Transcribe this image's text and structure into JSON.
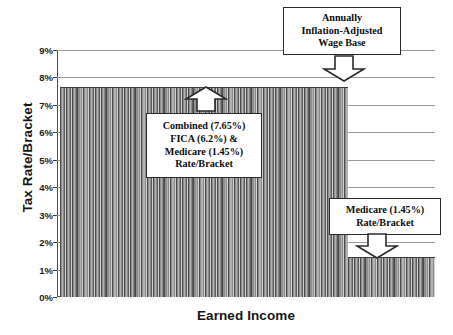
{
  "chart_data": {
    "type": "bar",
    "title": "",
    "subtitle": "",
    "xlabel": "Earned Income",
    "ylabel": "Tax Rate/Bracket",
    "ylim": [
      0,
      0.09
    ],
    "ytick_labels": [
      "9%",
      "8%",
      "7%",
      "6%",
      "5%",
      "4%",
      "3%",
      "2%",
      "1%",
      "0%"
    ],
    "ytick_values": [
      0.09,
      0.08,
      0.07,
      0.06,
      0.05,
      0.04,
      0.03,
      0.02,
      0.01,
      0.0
    ],
    "xtick_labels": [],
    "grid": true,
    "legend": "none",
    "series": [
      {
        "name": "Payroll tax rate",
        "segments": [
          {
            "label": "Combined FICA and Medicare",
            "value": 0.0765,
            "value_label": "7.65%",
            "x_start_fraction": 0.008,
            "x_end_fraction": 0.77
          },
          {
            "label": "Medicare only",
            "value": 0.0145,
            "value_label": "1.45%",
            "x_start_fraction": 0.77,
            "x_end_fraction": 1.0
          }
        ]
      }
    ],
    "breakpoint": {
      "label": "Annually Inflation-Adjusted Wage Base",
      "x_fraction": 0.77
    },
    "annotations": [
      {
        "id": "wage-base",
        "lines": [
          "Annually",
          "Inflation-Adjusted",
          "Wage Base"
        ],
        "arrow": "down"
      },
      {
        "id": "combined",
        "lines": [
          "Combined (7.65%)",
          "FICA (6.2%) &",
          "Medicare (1.45%)",
          "Rate/Bracket"
        ],
        "arrow": "up"
      },
      {
        "id": "medicare",
        "lines": [
          "Medicare (1.45%)",
          "Rate/Bracket"
        ],
        "arrow": "down"
      }
    ],
    "colors": {
      "bar_fill_light": "#b2b2b2",
      "bar_fill_mid": "#8e8e8e",
      "bar_edge": "#4a4a4a",
      "gridline": "#9a9a9a",
      "axis": "#4a4a4a",
      "text": "#0d0d0d",
      "background": "#ffffff"
    }
  },
  "axes": {
    "y": {
      "title": "Tax Rate/Bracket",
      "ticks": [
        {
          "label": "9%"
        },
        {
          "label": "8%"
        },
        {
          "label": "7%"
        },
        {
          "label": "6%"
        },
        {
          "label": "5%"
        },
        {
          "label": "4%"
        },
        {
          "label": "3%"
        },
        {
          "label": "2%"
        },
        {
          "label": "1%"
        },
        {
          "label": "0%"
        }
      ]
    },
    "x": {
      "title": "Earned Income"
    }
  },
  "callouts": {
    "wage_base": {
      "line1": "Annually",
      "line2": "Inflation-Adjusted",
      "line3": "Wage Base"
    },
    "combined": {
      "line1": "Combined (7.65%)",
      "line2": "FICA (6.2%) &",
      "line3": "Medicare (1.45%)",
      "line4": "Rate/Bracket"
    },
    "medicare": {
      "line1": "Medicare (1.45%)",
      "line2": "Rate/Bracket"
    }
  }
}
